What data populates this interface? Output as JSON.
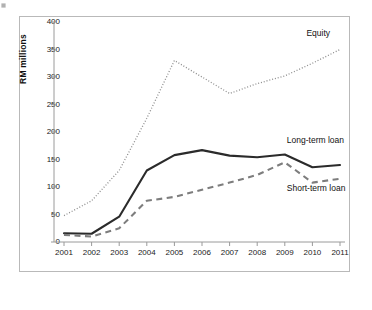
{
  "chart_data": {
    "type": "line",
    "title": "",
    "xlabel": "",
    "ylabel": "RM millions",
    "categories": [
      "2001",
      "2002",
      "2003",
      "2004",
      "2005",
      "2006",
      "2007",
      "2008",
      "2009",
      "2010",
      "2011"
    ],
    "ylim": [
      0,
      400
    ],
    "yticks": [
      0,
      50,
      100,
      150,
      200,
      250,
      300,
      350,
      400
    ],
    "grid": false,
    "legend_position": "inline-annotations",
    "series": [
      {
        "name": "Equity",
        "style": "dotted",
        "color": "#8c8c8c",
        "values": [
          48,
          75,
          130,
          225,
          330,
          300,
          270,
          288,
          302,
          325,
          350
        ]
      },
      {
        "name": "Long-term loan",
        "style": "solid",
        "color": "#2b2b2b",
        "values": [
          16,
          15,
          46,
          130,
          158,
          167,
          157,
          154,
          159,
          136,
          140
        ]
      },
      {
        "name": "Short-term loan",
        "style": "dashed",
        "color": "#7d7d7d",
        "values": [
          13,
          10,
          25,
          75,
          82,
          95,
          108,
          122,
          145,
          108,
          115
        ]
      }
    ],
    "annotations": [
      {
        "text": "Equity",
        "series": "Equity"
      },
      {
        "text": "Long-term loan",
        "series": "Long-term loan"
      },
      {
        "text": "Short-term loan",
        "series": "Short-term loan"
      }
    ]
  }
}
